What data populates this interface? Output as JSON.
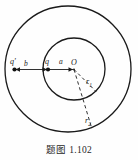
{
  "figure": {
    "caption": "题图 1.102",
    "title": "题图 1.102",
    "stroke_color": "#1a1a1a",
    "background_color": "#fefefe",
    "labels": {
      "charge_outer": "q'",
      "distance_b": "b",
      "charge_inner": "q",
      "distance_a": "a",
      "center": "O",
      "radius_inner": "r",
      "radius_inner_sub": "1",
      "radius_outer": "r",
      "radius_outer_sub": "2"
    },
    "geometry": {
      "center_x": 74,
      "center_y": 69,
      "outer_radius": 63,
      "inner_radius": 31,
      "charge_q_x": 48,
      "charge_q_y": 69,
      "charge_qprime_x": 14,
      "charge_qprime_y": 70
    }
  }
}
